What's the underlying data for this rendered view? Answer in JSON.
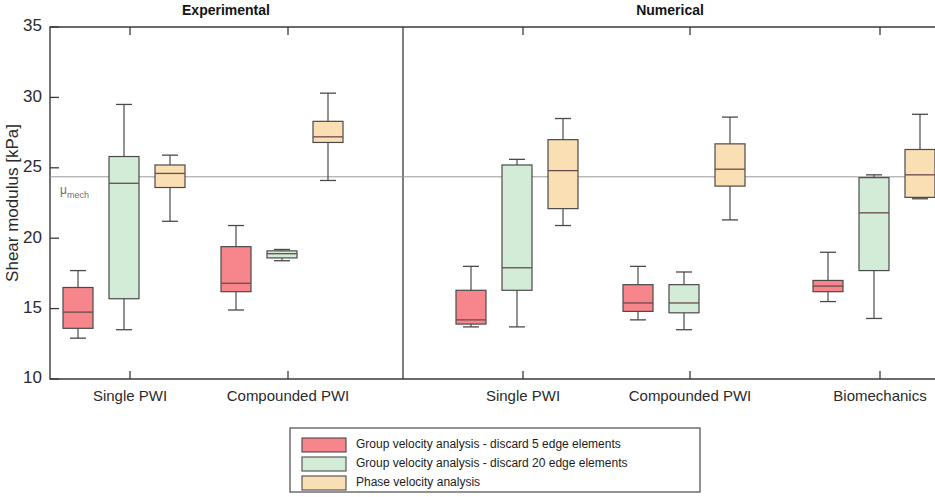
{
  "chart_data": {
    "type": "box",
    "title": "",
    "xlabel": "",
    "ylabel": "Shear modulus [kPa]",
    "ylim": [
      10,
      35
    ],
    "yticks": [
      10,
      15,
      20,
      25,
      30,
      35
    ],
    "grid": false,
    "legend_position": "bottom-center",
    "panels": [
      {
        "name": "Experimental",
        "label": "Experimental"
      },
      {
        "name": "Numerical",
        "label": "Numerical"
      }
    ],
    "reference_line": {
      "label": "μ",
      "sublabel": "mech",
      "value": 24.36,
      "color": "#8d8d8d"
    },
    "legend": [
      {
        "label": "Group velocity analysis - discard 5 edge elements",
        "color": "#f6868b"
      },
      {
        "label": "Group velocity analysis - discard 20 edge elements",
        "color": "#d3ecd8"
      },
      {
        "label": "Phase velocity analysis",
        "color": "#fadfb4"
      }
    ],
    "series": [
      {
        "name": "Group velocity analysis - discard 5 edge elements",
        "color": "#f6868b"
      },
      {
        "name": "Group velocity analysis - discard 20 edge elements",
        "color": "#d3ecd8"
      },
      {
        "name": "Phase velocity analysis",
        "color": "#fadfb4"
      }
    ],
    "categories": [
      {
        "label": "Single PWI",
        "panel": "Experimental"
      },
      {
        "label": "Compounded PWI",
        "panel": "Experimental"
      },
      {
        "label": "Single PWI",
        "panel": "Numerical"
      },
      {
        "label": "Compounded PWI",
        "panel": "Numerical"
      },
      {
        "label": "Biomechanics",
        "panel": "Numerical"
      }
    ],
    "boxes": [
      {
        "category": "Single PWI",
        "panel": "Experimental",
        "series": "Group velocity analysis - discard 5 edge elements",
        "whisker_low": 12.9,
        "q1": 13.6,
        "median": 14.75,
        "q3": 16.5,
        "whisker_high": 17.7
      },
      {
        "category": "Single PWI",
        "panel": "Experimental",
        "series": "Group velocity analysis - discard 20 edge elements",
        "whisker_low": 13.5,
        "q1": 15.7,
        "median": 23.9,
        "q3": 25.8,
        "whisker_high": 29.5
      },
      {
        "category": "Single PWI",
        "panel": "Experimental",
        "series": "Phase velocity analysis",
        "whisker_low": 21.2,
        "q1": 23.6,
        "median": 24.6,
        "q3": 25.2,
        "whisker_high": 25.9
      },
      {
        "category": "Compounded PWI",
        "panel": "Experimental",
        "series": "Group velocity analysis - discard 5 edge elements",
        "whisker_low": 14.9,
        "q1": 16.2,
        "median": 16.8,
        "q3": 19.4,
        "whisker_high": 20.9
      },
      {
        "category": "Compounded PWI",
        "panel": "Experimental",
        "series": "Group velocity analysis - discard 20 edge elements",
        "whisker_low": 18.4,
        "q1": 18.6,
        "median": 18.9,
        "q3": 19.1,
        "whisker_high": 19.2
      },
      {
        "category": "Compounded PWI",
        "panel": "Experimental",
        "series": "Phase velocity analysis",
        "whisker_low": 24.1,
        "q1": 26.8,
        "median": 27.2,
        "q3": 28.3,
        "whisker_high": 30.3
      },
      {
        "category": "Single PWI",
        "panel": "Numerical",
        "series": "Group velocity analysis - discard 5 edge elements",
        "whisker_low": 13.7,
        "q1": 13.9,
        "median": 14.2,
        "q3": 16.3,
        "whisker_high": 18.0
      },
      {
        "category": "Single PWI",
        "panel": "Numerical",
        "series": "Group velocity analysis - discard 20 edge elements",
        "whisker_low": 13.7,
        "q1": 16.3,
        "median": 17.9,
        "q3": 25.2,
        "whisker_high": 25.6
      },
      {
        "category": "Single PWI",
        "panel": "Numerical",
        "series": "Phase velocity analysis",
        "whisker_low": 20.9,
        "q1": 22.1,
        "median": 24.8,
        "q3": 27.0,
        "whisker_high": 28.5
      },
      {
        "category": "Compounded PWI",
        "panel": "Numerical",
        "series": "Group velocity analysis - discard 5 edge elements",
        "whisker_low": 14.2,
        "q1": 14.8,
        "median": 15.4,
        "q3": 16.7,
        "whisker_high": 18.0
      },
      {
        "category": "Compounded PWI",
        "panel": "Numerical",
        "series": "Group velocity analysis - discard 20 edge elements",
        "whisker_low": 13.5,
        "q1": 14.7,
        "median": 15.4,
        "q3": 16.7,
        "whisker_high": 17.6
      },
      {
        "category": "Compounded PWI",
        "panel": "Numerical",
        "series": "Phase velocity analysis",
        "whisker_low": 21.3,
        "q1": 23.7,
        "median": 24.9,
        "q3": 26.7,
        "whisker_high": 28.6
      },
      {
        "category": "Biomechanics",
        "panel": "Numerical",
        "series": "Group velocity analysis - discard 5 edge elements",
        "whisker_low": 15.5,
        "q1": 16.2,
        "median": 16.6,
        "q3": 17.0,
        "whisker_high": 19.0
      },
      {
        "category": "Biomechanics",
        "panel": "Numerical",
        "series": "Group velocity analysis - discard 20 edge elements",
        "whisker_low": 14.3,
        "q1": 17.7,
        "median": 21.8,
        "q3": 24.3,
        "whisker_high": 24.5
      },
      {
        "category": "Biomechanics",
        "panel": "Numerical",
        "series": "Phase velocity analysis",
        "whisker_low": 22.8,
        "q1": 22.9,
        "median": 24.5,
        "q3": 26.3,
        "whisker_high": 28.8
      }
    ]
  },
  "layout": {
    "plot_left": 50,
    "plot_right": 935,
    "plot_top": 27,
    "plot_bottom": 379,
    "divider_x": 403,
    "group_centers": [
      130,
      288,
      523,
      690,
      880
    ],
    "box_offsets": [
      -52,
      -6,
      40
    ],
    "box_width": 30,
    "panel_title_x": [
      226,
      670
    ],
    "panel_title_y": 15
  }
}
